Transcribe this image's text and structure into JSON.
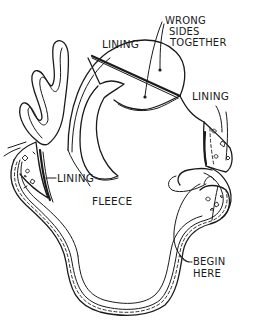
{
  "labels": {
    "wrong_sides_together": [
      "WRONG",
      "SIDES",
      "TOGETHER"
    ],
    "lining_top": "LINING",
    "lining_right": "LINING",
    "lining_left": "LINING",
    "fleece": "FLEECE",
    "begin_here": [
      "BEGIN",
      "HERE"
    ]
  },
  "colors": {
    "ink": "#1a1a1a",
    "paper": "#ffffff"
  }
}
